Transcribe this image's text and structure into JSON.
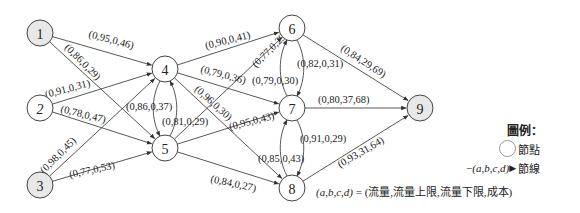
{
  "colors": {
    "source_sink_fill": "#e8e8e8",
    "node_fill": "#ffffff",
    "stroke": "#444444"
  },
  "nodes": [
    {
      "id": "1",
      "label": "1",
      "x": 40,
      "y": 33,
      "shaded": true,
      "italic": false
    },
    {
      "id": "2",
      "label": "2",
      "x": 40,
      "y": 108,
      "shaded": false,
      "italic": true
    },
    {
      "id": "3",
      "label": "3",
      "x": 40,
      "y": 185,
      "shaded": true,
      "italic": false
    },
    {
      "id": "4",
      "label": "4",
      "x": 165,
      "y": 69,
      "shaded": false,
      "italic": false
    },
    {
      "id": "5",
      "label": "5",
      "x": 165,
      "y": 148,
      "shaded": false,
      "italic": false
    },
    {
      "id": "6",
      "label": "6",
      "x": 292,
      "y": 28,
      "shaded": false,
      "italic": false
    },
    {
      "id": "7",
      "label": "7",
      "x": 292,
      "y": 108,
      "shaded": false,
      "italic": false
    },
    {
      "id": "8",
      "label": "8",
      "x": 292,
      "y": 188,
      "shaded": false,
      "italic": false
    },
    {
      "id": "9",
      "label": "9",
      "x": 420,
      "y": 108,
      "shaded": true,
      "italic": false
    }
  ],
  "edges": [
    {
      "from": "1",
      "to": "4",
      "label": "(0,95,0,46)",
      "lx": 88,
      "ly": 37,
      "rot": 15
    },
    {
      "from": "1",
      "to": "5",
      "label": "(0,86,0,29)",
      "lx": 64,
      "ly": 48,
      "rot": 45
    },
    {
      "from": "2",
      "to": "4",
      "label": "(0,91,0,31)",
      "lx": 46,
      "ly": 98,
      "rot": -15
    },
    {
      "from": "2",
      "to": "5",
      "label": "(0,78,0,47)",
      "lx": 60,
      "ly": 112,
      "rot": 14
    },
    {
      "from": "3",
      "to": "4",
      "label": "(0,98,0,45)",
      "lx": 44,
      "ly": 174,
      "rot": -45
    },
    {
      "from": "3",
      "to": "5",
      "label": "(0,77,0,53)",
      "lx": 70,
      "ly": 178,
      "rot": -12
    },
    {
      "from": "4",
      "to": "5",
      "label": "(0,86,0,37)",
      "lx": 126,
      "ly": 110,
      "rot": 0,
      "curve": "left"
    },
    {
      "from": "5",
      "to": "4",
      "label": "(0,81,0,29)",
      "lx": 162,
      "ly": 125,
      "rot": 0,
      "curve": "right"
    },
    {
      "from": "4",
      "to": "6",
      "label": "(0,90,0,41)",
      "lx": 206,
      "ly": 49,
      "rot": -14
    },
    {
      "from": "4",
      "to": "7",
      "label": "(0,79,0,36)",
      "lx": 200,
      "ly": 72,
      "rot": 15
    },
    {
      "from": "4",
      "to": "8",
      "label": "(0,96,0,30)",
      "lx": 194,
      "ly": 90,
      "rot": 42
    },
    {
      "from": "5",
      "to": "6",
      "label": "(0,77,0,29)",
      "lx": 256,
      "ly": 68,
      "rot": -45
    },
    {
      "from": "5",
      "to": "7",
      "label": "(0,95,0,43)",
      "lx": 230,
      "ly": 130,
      "rot": -14
    },
    {
      "from": "5",
      "to": "8",
      "label": "(0,84,0,27)",
      "lx": 210,
      "ly": 182,
      "rot": 12
    },
    {
      "from": "6",
      "to": "7",
      "label": "(0,82,0,31)",
      "lx": 297,
      "ly": 67,
      "rot": 0,
      "curve": "right"
    },
    {
      "from": "7",
      "to": "6",
      "label": "(0,79,0,30)",
      "lx": 252,
      "ly": 84,
      "rot": 0,
      "curve": "left"
    },
    {
      "from": "7",
      "to": "8",
      "label": "(0,91,0,29)",
      "lx": 300,
      "ly": 142,
      "rot": 0,
      "curve": "right"
    },
    {
      "from": "8",
      "to": "7",
      "label": "(0,85,0,43)",
      "lx": 258,
      "ly": 162,
      "rot": 0,
      "curve": "left"
    },
    {
      "from": "6",
      "to": "9",
      "label": "(0,84,29,69)",
      "lx": 340,
      "ly": 50,
      "rot": 33
    },
    {
      "from": "7",
      "to": "9",
      "label": "(0,80,37,68)",
      "lx": 318,
      "ly": 103,
      "rot": 0
    },
    {
      "from": "8",
      "to": "9",
      "label": "(0,93,31,64)",
      "lx": 340,
      "ly": 168,
      "rot": -30
    }
  ],
  "legend": {
    "title": "圖例：",
    "node_label": "節點",
    "edge_glyph": "(a,b,c,d)",
    "edge_label": "節線",
    "formula_lhs": "(a,b,c,d)",
    "formula_rhs": " = (流量,流量上限,流量下限,成本)"
  }
}
